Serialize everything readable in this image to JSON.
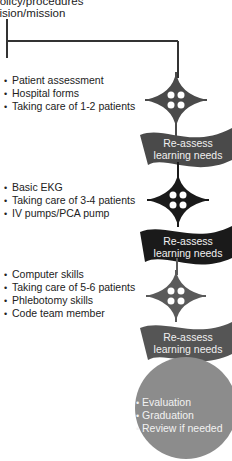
{
  "header": {
    "line1": "Policy/procedures",
    "line2": "Vision/mission"
  },
  "stages": [
    {
      "items": [
        "Patient assessment",
        "Hospital forms",
        "Taking care of 1-2 patients"
      ],
      "banner": {
        "line1": "Re-assess",
        "line2": "learning needs",
        "color": "#4a4a4a"
      }
    },
    {
      "items": [
        "Basic EKG",
        "Taking care of 3-4 patients",
        "IV pumps/PCA pump"
      ],
      "banner": {
        "line1": "Re-assess",
        "line2": "learning needs",
        "color": "#1a1a1a"
      }
    },
    {
      "items": [
        "Computer skills",
        "Taking care of 5-6 patients",
        "Phlebotomy skills",
        "Code team member"
      ],
      "banner": {
        "line1": "Re-assess",
        "line2": "learning needs",
        "color": "#555555"
      }
    }
  ],
  "final": {
    "items": [
      "Evaluation",
      "Graduation",
      "Review if needed"
    ],
    "color": "#8c8c8c"
  },
  "colors": {
    "diamond_1": "#4a4a4a",
    "diamond_2": "#1a1a1a",
    "diamond_3": "#5a5a5a",
    "line": "#333333"
  }
}
